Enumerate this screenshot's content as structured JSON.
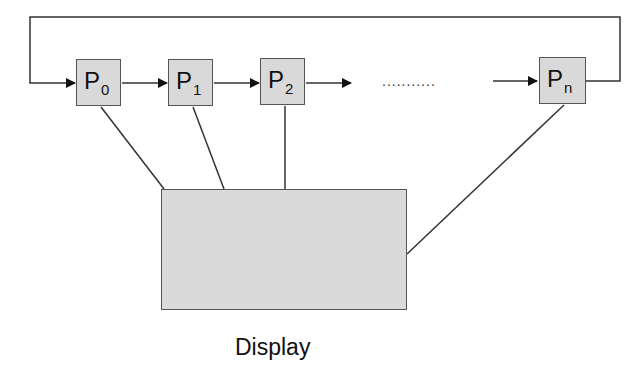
{
  "diagram": {
    "type": "ring-of-processes",
    "processes": [
      {
        "label": "P",
        "subscript": "0"
      },
      {
        "label": "P",
        "subscript": "1"
      },
      {
        "label": "P",
        "subscript": "2"
      },
      {
        "label": "P",
        "subscript": "n"
      }
    ],
    "ellipsis": "...........",
    "display": {
      "label": "Display"
    },
    "colors": {
      "box_fill": "#d9d9d9",
      "stroke": "#333333",
      "background": "#ffffff"
    }
  }
}
